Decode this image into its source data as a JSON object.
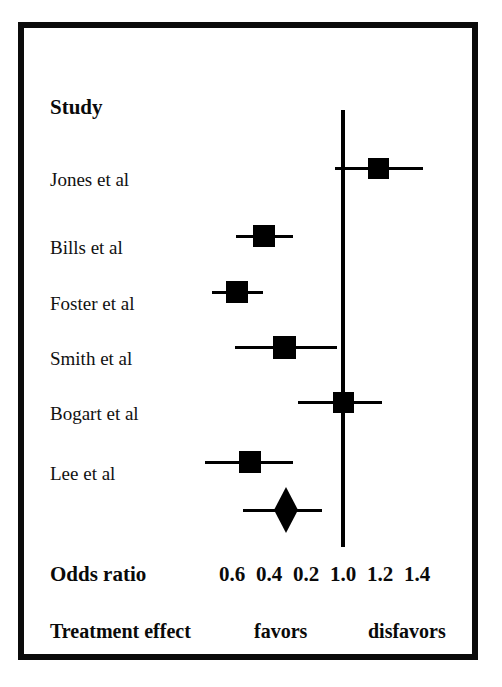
{
  "figure": {
    "type": "forest-plot",
    "frame_color": "#0b0b0b",
    "background": "#ffffff",
    "marker_color": "#000000"
  },
  "columns": {
    "study_header": "Study",
    "axis_row_label": "Odds ratio",
    "footer_row_label": "Treatment effect"
  },
  "footer": {
    "favors": "favors",
    "disfavors": "disfavors"
  },
  "chart_data": {
    "type": "forest",
    "title": "",
    "xlabel": "Odds ratio",
    "ylabel": "Study",
    "null_value": "1.0",
    "tick_labels": [
      "0.6",
      "0.4",
      "0.2",
      "1.0",
      "1.2",
      "1.4"
    ],
    "tick_x_px": [
      232,
      269,
      306,
      343,
      380,
      417
    ],
    "null_line_x_px": 343,
    "grid": false,
    "legend": "none",
    "footer_annotations": [
      "favors",
      "disfavors"
    ],
    "studies": [
      {
        "label": "Jones et al",
        "estimate_x_px": 378,
        "ci_low_x_px": 335,
        "ci_high_x_px": 423,
        "marker_size_px": 21,
        "row_y_px": 168
      },
      {
        "label": "Bills et al",
        "estimate_x_px": 264,
        "ci_low_x_px": 236,
        "ci_high_x_px": 293,
        "marker_size_px": 22,
        "row_y_px": 236
      },
      {
        "label": "Foster et al",
        "estimate_x_px": 237,
        "ci_low_x_px": 212,
        "ci_high_x_px": 263,
        "marker_size_px": 22,
        "row_y_px": 292
      },
      {
        "label": "Smith et al",
        "estimate_x_px": 284,
        "ci_low_x_px": 235,
        "ci_high_x_px": 337,
        "marker_size_px": 23,
        "row_y_px": 347
      },
      {
        "label": "Bogart et al",
        "estimate_x_px": 343,
        "ci_low_x_px": 298,
        "ci_high_x_px": 382,
        "marker_size_px": 21,
        "row_y_px": 402
      },
      {
        "label": "Lee et al",
        "estimate_x_px": 250,
        "ci_low_x_px": 205,
        "ci_high_x_px": 293,
        "marker_size_px": 22,
        "row_y_px": 462
      }
    ],
    "summary": {
      "label": "",
      "estimate_x_px": 286,
      "ci_low_x_px": 243,
      "ci_high_x_px": 322,
      "row_y_px": 510,
      "diamond_width_px": 24,
      "diamond_height_px": 46
    }
  }
}
